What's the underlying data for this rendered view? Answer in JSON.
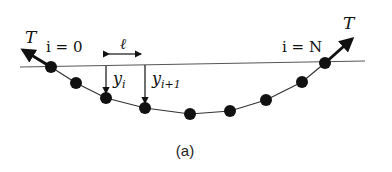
{
  "diagram": {
    "caption": "(a)",
    "labels": {
      "tension_left": "T",
      "tension_right": "T",
      "start_index": "i = 0",
      "end_index": "i = N",
      "spacing": "ℓ",
      "y_i": "y",
      "y_i_sub": "i",
      "y_i1": "y",
      "y_i1_sub": "i+1"
    },
    "baseline": {
      "x1": 20,
      "y1": 67,
      "x2": 365,
      "y2": 61
    },
    "masses": [
      {
        "x": 51,
        "y": 67
      },
      {
        "x": 76,
        "y": 83
      },
      {
        "x": 106,
        "y": 98
      },
      {
        "x": 145,
        "y": 108
      },
      {
        "x": 190,
        "y": 114
      },
      {
        "x": 230,
        "y": 111
      },
      {
        "x": 266,
        "y": 100
      },
      {
        "x": 302,
        "y": 82
      },
      {
        "x": 325,
        "y": 63
      }
    ],
    "colors": {
      "ink": "#111111",
      "line": "#555555"
    }
  }
}
